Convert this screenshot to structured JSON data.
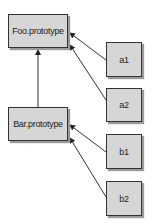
{
  "diagram": {
    "nodes": [
      {
        "id": "foo",
        "label": "Foo.prototype"
      },
      {
        "id": "bar",
        "label": "Bar.prototype"
      },
      {
        "id": "a1",
        "label": "a1"
      },
      {
        "id": "a2",
        "label": "a2"
      },
      {
        "id": "b1",
        "label": "b1"
      },
      {
        "id": "b2",
        "label": "b2"
      }
    ],
    "edges": [
      {
        "from": "a1",
        "to": "foo"
      },
      {
        "from": "a2",
        "to": "foo"
      },
      {
        "from": "bar",
        "to": "foo"
      },
      {
        "from": "b1",
        "to": "bar"
      },
      {
        "from": "b2",
        "to": "bar"
      }
    ],
    "colors": {
      "box_fill": "#d6d6d6",
      "stroke": "#333333"
    }
  }
}
